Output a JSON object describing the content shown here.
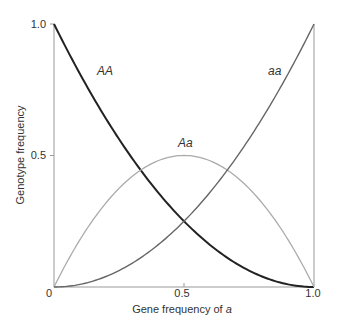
{
  "chart_data": {
    "type": "line",
    "title": "",
    "xlabel": "Gene frequency of a",
    "xlabel_prefix": "Gene frequency of ",
    "xlabel_italic": "a",
    "ylabel": "Genotype frequency",
    "xlim": [
      0,
      1
    ],
    "ylim": [
      0,
      1
    ],
    "grid": false,
    "x_ticks": [
      "0",
      "0.5",
      "1.0"
    ],
    "y_ticks": [
      "0.5",
      "1.0"
    ],
    "x": [
      0,
      0.1,
      0.2,
      0.3,
      0.4,
      0.5,
      0.6,
      0.7,
      0.8,
      0.9,
      1.0
    ],
    "series": [
      {
        "name": "AA",
        "formula": "(1-q)^2",
        "color": "#222222",
        "values": [
          1.0,
          0.81,
          0.64,
          0.49,
          0.36,
          0.25,
          0.16,
          0.09,
          0.04,
          0.01,
          0.0
        ]
      },
      {
        "name": "Aa",
        "formula": "2q(1-q)",
        "color": "#aaaaaa",
        "values": [
          0.0,
          0.18,
          0.32,
          0.42,
          0.48,
          0.5,
          0.48,
          0.42,
          0.32,
          0.18,
          0.0
        ]
      },
      {
        "name": "aa",
        "formula": "q^2",
        "color": "#666666",
        "values": [
          0.0,
          0.01,
          0.04,
          0.09,
          0.16,
          0.25,
          0.36,
          0.49,
          0.64,
          0.81,
          1.0
        ]
      }
    ],
    "annotations": [
      {
        "text": "AA",
        "x": 0.2,
        "y": 0.78
      },
      {
        "text": "Aa",
        "x": 0.5,
        "y": 0.56
      },
      {
        "text": "aa",
        "x": 0.8,
        "y": 0.78
      }
    ]
  }
}
